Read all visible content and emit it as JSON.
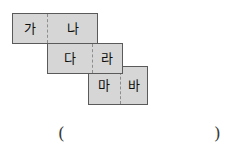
{
  "figure": {
    "name": "staircase-domino-figure",
    "background_color": "#ffffff",
    "fill_color": "#d6d6d6",
    "border_color": "#5a5a5a",
    "divider_color": "#8d8d8d",
    "text_color": "#0d0d0d",
    "blocks": [
      {
        "id": "block-1",
        "cells": [
          {
            "label": "가"
          },
          {
            "label": "나"
          }
        ]
      },
      {
        "id": "block-2",
        "cells": [
          {
            "label": "다"
          },
          {
            "label": "라"
          }
        ]
      },
      {
        "id": "block-3",
        "cells": [
          {
            "label": "마"
          },
          {
            "label": "바"
          }
        ]
      }
    ]
  },
  "answer": {
    "open_paren": "(",
    "close_paren": ")",
    "value": ""
  }
}
